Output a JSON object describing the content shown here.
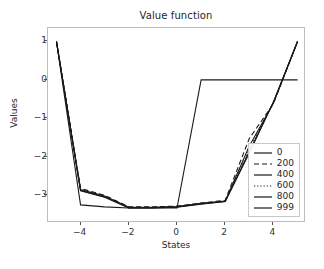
{
  "chart_data": {
    "type": "line",
    "title": "Value function",
    "xlabel": "States",
    "ylabel": "Values",
    "xlim": [
      -5.35,
      5.35
    ],
    "ylim": [
      -3.72,
      1.35
    ],
    "xticks": [
      -4,
      -2,
      0,
      2,
      4
    ],
    "xtick_labels": [
      "−4",
      "−2",
      "0",
      "2",
      "4"
    ],
    "yticks": [
      1,
      0,
      -1,
      -2,
      -3
    ],
    "ytick_labels": [
      "1",
      "0",
      "−1",
      "−2",
      "−3"
    ],
    "grid": false,
    "legend_position": "lower right",
    "x": [
      -5,
      -4,
      -3,
      -2,
      -1,
      0,
      1,
      2,
      3,
      4,
      5
    ],
    "series": [
      {
        "name": "0",
        "label": "0",
        "style": "solid",
        "color": "#1a1a1a",
        "values": [
          1.0,
          -3.25,
          -3.3,
          -3.33,
          -3.33,
          -3.33,
          0.0,
          0.0,
          0.0,
          0.0,
          0.0
        ]
      },
      {
        "name": "200",
        "label": "200",
        "style": "dashed",
        "color": "#1a1a1a",
        "values": [
          1.0,
          -2.82,
          -3.0,
          -3.3,
          -3.3,
          -3.28,
          -3.2,
          -3.13,
          -1.52,
          -0.62,
          1.0
        ]
      },
      {
        "name": "400",
        "label": "400",
        "style": "solid",
        "color": "#1a1a1a",
        "values": [
          1.0,
          -2.85,
          -3.02,
          -3.31,
          -3.31,
          -3.29,
          -3.21,
          -3.15,
          -1.72,
          -0.6,
          1.0
        ]
      },
      {
        "name": "600",
        "label": "600",
        "style": "dotted",
        "color": "#1a1a1a",
        "values": [
          1.0,
          -2.86,
          -3.03,
          -3.32,
          -3.32,
          -3.3,
          -3.22,
          -3.15,
          -1.8,
          -0.59,
          1.0
        ]
      },
      {
        "name": "800",
        "label": "800",
        "style": "solid",
        "color": "#1a1a1a",
        "values": [
          1.0,
          -2.87,
          -3.04,
          -3.32,
          -3.32,
          -3.3,
          -3.22,
          -3.16,
          -1.86,
          -0.58,
          1.0
        ]
      },
      {
        "name": "999",
        "label": "999",
        "style": "solid",
        "color": "#1a1a1a",
        "values": [
          1.0,
          -2.88,
          -3.05,
          -3.33,
          -3.33,
          -3.31,
          -3.23,
          -3.16,
          -1.9,
          -0.57,
          1.0
        ]
      }
    ],
    "annotations": []
  }
}
